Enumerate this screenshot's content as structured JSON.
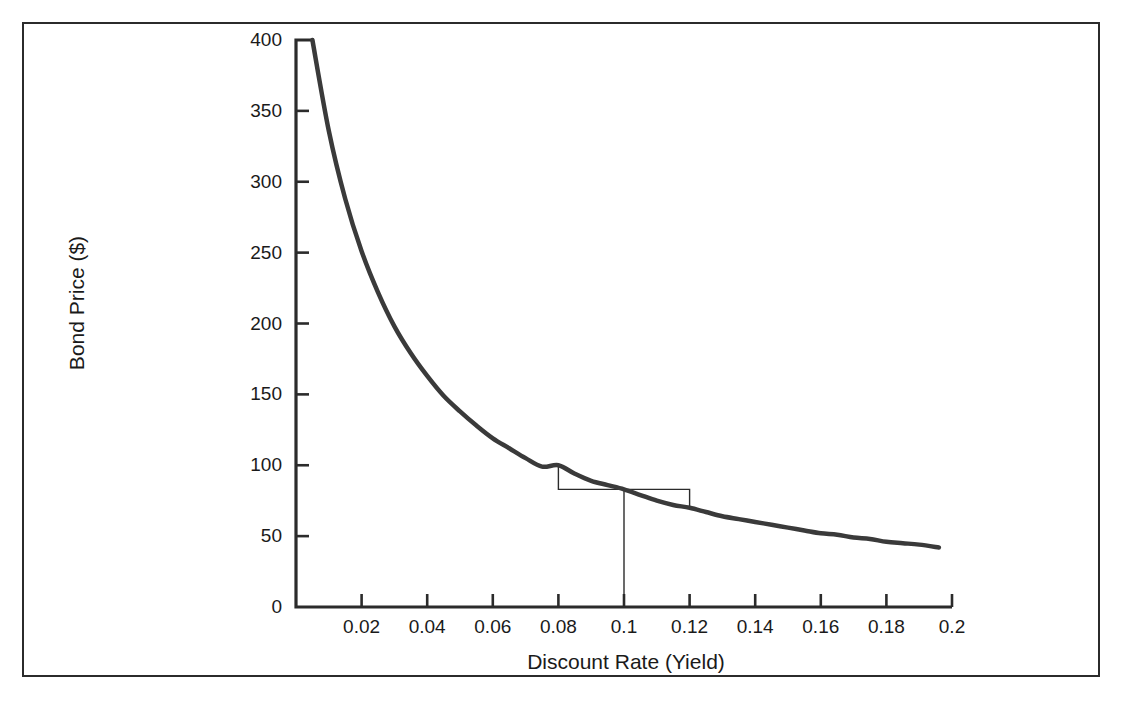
{
  "figure": {
    "title": "",
    "title_visible": false,
    "background": "#ffffff",
    "frame_color": "#2b2b2b"
  },
  "chart_data": {
    "type": "line",
    "title": "",
    "xlabel": "Discount Rate (Yield)",
    "ylabel": "Bond Price ($)",
    "xlim": [
      0.0,
      0.2
    ],
    "ylim": [
      0,
      400
    ],
    "xticks": [
      0.02,
      0.04,
      0.06,
      0.08,
      0.1,
      0.12,
      0.14,
      0.16,
      0.18,
      0.2
    ],
    "xtick_labels": [
      "0.02",
      "0.04",
      "0.06",
      "0.08",
      "0.1",
      "0.12",
      "0.14",
      "0.16",
      "0.18",
      "0.2"
    ],
    "yticks": [
      0,
      50,
      100,
      150,
      200,
      250,
      300,
      350,
      400
    ],
    "ytick_labels": [
      "0",
      "50",
      "100",
      "150",
      "200",
      "250",
      "300",
      "350",
      "400"
    ],
    "grid": false,
    "legend": false,
    "series": [
      {
        "name": "Bond Price",
        "color": "#3a3a3a",
        "line_width": 4.5,
        "x": [
          0.005,
          0.01,
          0.015,
          0.02,
          0.025,
          0.03,
          0.035,
          0.04,
          0.045,
          0.05,
          0.055,
          0.06,
          0.065,
          0.07,
          0.075,
          0.08,
          0.085,
          0.09,
          0.095,
          0.1,
          0.105,
          0.11,
          0.115,
          0.12,
          0.125,
          0.13,
          0.135,
          0.14,
          0.145,
          0.15,
          0.155,
          0.16,
          0.165,
          0.17,
          0.175,
          0.18,
          0.185,
          0.19,
          0.196
        ],
        "y": [
          400.0,
          336.0,
          288.0,
          251.0,
          222.0,
          198.0,
          179.0,
          163.0,
          149.0,
          138.0,
          128.0,
          119.0,
          112.0,
          105.0,
          99.0,
          100.0,
          94.0,
          89.0,
          86.0,
          83.0,
          79.0,
          75.0,
          72.0,
          70.0,
          67.0,
          64.0,
          62.0,
          60.0,
          58.0,
          56.0,
          54.0,
          52.0,
          51.0,
          49.0,
          48.0,
          46.0,
          45.0,
          44.0,
          42.0
        ]
      }
    ],
    "annotations": {
      "description": "Price-yield convexity construction at base yield 0.1",
      "base_yield": 0.1,
      "base_price": 83,
      "left_yield": 0.08,
      "left_price": 100,
      "right_yield": 0.12,
      "right_price": 70,
      "line_color": "#2b2b2b",
      "line_width": 1.4
    }
  },
  "axis_labels": {
    "y_axis": "Bond Price ($)",
    "x_axis": "Discount Rate (Yield)"
  }
}
